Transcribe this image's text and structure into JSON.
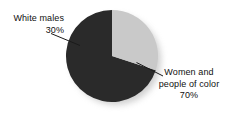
{
  "chart_data": {
    "type": "pie",
    "title": "",
    "subtitle": "",
    "xlabel": "",
    "ylabel": "",
    "legend_position": "none",
    "grid": false,
    "units": "percent",
    "total": 100,
    "categories": [
      "White males",
      "Women and people of color"
    ],
    "values": [
      30,
      70
    ],
    "slices": [
      {
        "label": "White males",
        "label_lines": [
          "White males",
          "30%"
        ],
        "value": 30,
        "value_text": "30%",
        "color": "#c9c9c9",
        "start_angle_deg": 252,
        "end_angle_deg": 360,
        "sweep_deg": 108,
        "label_align": "right",
        "leader_line": true
      },
      {
        "label": "Women and people of color",
        "label_lines": [
          "Women and",
          "people of color",
          "70%"
        ],
        "value": 70,
        "value_text": "70%",
        "color": "#2a2a2a",
        "start_angle_deg": 0,
        "end_angle_deg": 252,
        "sweep_deg": 252,
        "label_align": "center",
        "leader_line": true
      }
    ],
    "annotations": []
  },
  "figure": {
    "background_color": "#ffffff",
    "text_color": "#101010",
    "shadow_color": "#b4b4b4",
    "geometry": {
      "center_x": 112,
      "center_y": 56,
      "radius": 46,
      "start_at_12_oclock": true,
      "shadow_offset_x": 4,
      "shadow_offset_y": 4
    }
  },
  "labels": {
    "white_males": {
      "line1": "White males",
      "line2": "30%"
    },
    "women_poc": {
      "line1": "Women and",
      "line2": "people of color",
      "line3": "70%"
    }
  }
}
